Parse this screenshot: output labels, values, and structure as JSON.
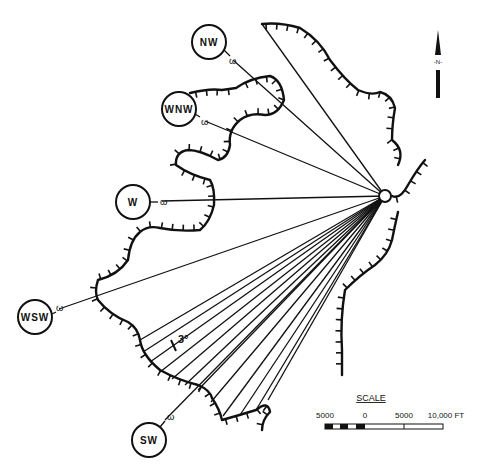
{
  "directions": [
    {
      "label": "NW",
      "marker": "ω"
    },
    {
      "label": "WNW",
      "marker": "ω"
    },
    {
      "label": "W",
      "marker": "ω"
    },
    {
      "label": "WSW",
      "marker": "ω"
    },
    {
      "label": "SW",
      "marker": "ω"
    }
  ],
  "angle_label": "3°",
  "north_arrow": {
    "label": "-N-"
  },
  "scale": {
    "title": "SCALE",
    "ticks": [
      "5000",
      "0",
      "5000",
      "10,000 FT"
    ]
  },
  "colors": {
    "ink": "#111111",
    "paper": "#ffffff"
  }
}
